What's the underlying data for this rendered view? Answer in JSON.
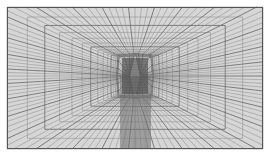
{
  "figure": {
    "name": "structured-curvilinear-mesh",
    "type": "computational-mesh",
    "title": "",
    "caption": "",
    "width": 271,
    "height": 158
  },
  "colors": {
    "page_background": "#ffffff",
    "mesh_fill": "#d6d6d6",
    "grid_line": "#6a6a6a",
    "grid_line_light": "#8e8e8e",
    "border": "#555555",
    "dense_core": "#4a4a4a"
  },
  "domain": {
    "x_min": 7,
    "y_min": 7,
    "x_max": 263,
    "y_max": 149,
    "border_width": 1
  },
  "chart_data": {
    "type": "mesh",
    "title": "",
    "xlabel": "",
    "ylabel": "",
    "grid": true,
    "legend": "none",
    "center": {
      "x": 135,
      "y": 76
    },
    "symmetry": [
      "left-right",
      "top-bottom"
    ],
    "radial_lines": 31,
    "circumferential_lines": 26,
    "core": {
      "x": 135,
      "y": 76,
      "half_width": 13,
      "half_height": 18,
      "refined_columns": 26,
      "refined_rows": 22
    },
    "wake_band": {
      "x_min": 120,
      "x_max": 151,
      "y_min": 76,
      "y_max": 149,
      "columns": 28
    },
    "clustering": {
      "radial_stretch": 2.35,
      "axial_stretch": 1.85
    }
  }
}
